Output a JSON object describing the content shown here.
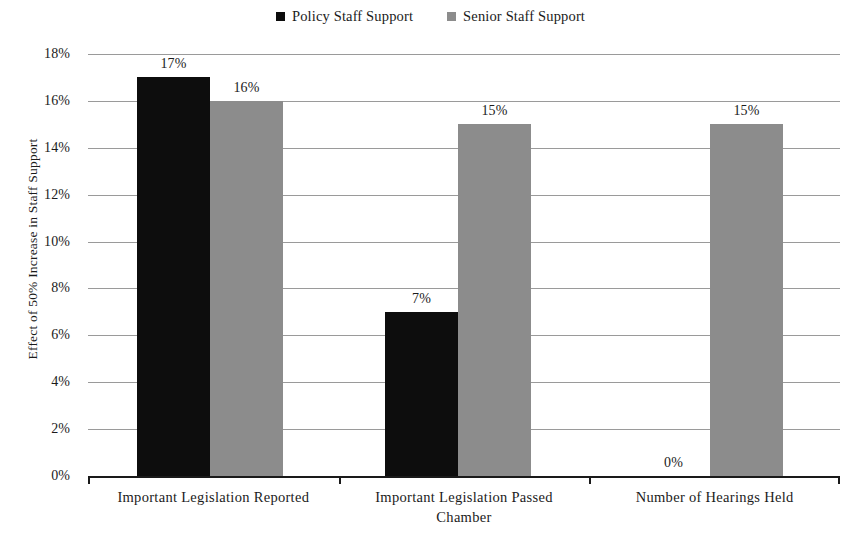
{
  "chart_data": {
    "type": "bar",
    "title": "",
    "subtitle": "",
    "xlabel": "",
    "ylabel": "Effect of 50% Increase in Staff Support",
    "categories": [
      "Important Legislation Reported",
      "Important Legislation Passed\nChamber",
      "Number of Hearings Held"
    ],
    "series": [
      {
        "name": "Policy Staff Support",
        "color": "#0d0d0d",
        "values": [
          17,
          7,
          0
        ],
        "value_labels": [
          "17%",
          "7%",
          "0%"
        ]
      },
      {
        "name": "Senior Staff Support",
        "color": "#8c8c8c",
        "values": [
          16,
          15,
          15
        ],
        "value_labels": [
          "16%",
          "15%",
          "15%"
        ]
      }
    ],
    "ylim": [
      0,
      18
    ],
    "ytick_values": [
      0,
      2,
      4,
      6,
      8,
      10,
      12,
      14,
      16,
      18
    ],
    "ytick_labels": [
      "0%",
      "2%",
      "4%",
      "6%",
      "8%",
      "10%",
      "12%",
      "14%",
      "16%",
      "18%"
    ],
    "grid": true,
    "legend_position": "top-center",
    "units": "percent"
  },
  "legend": {
    "items": [
      {
        "label": "Policy Staff Support",
        "color": "#0d0d0d",
        "marker": "square-marker"
      },
      {
        "label": "Senior Staff Support",
        "color": "#8c8c8c",
        "marker": "square-marker"
      }
    ]
  },
  "axes": {
    "y_title": "Effect of 50% Increase in Staff Support",
    "y_ticks": [
      "18%",
      "16%",
      "14%",
      "12%",
      "10%",
      "8%",
      "6%",
      "4%",
      "2%",
      "0%"
    ],
    "x_categories": [
      "Important Legislation Reported",
      "Important Legislation Passed\nChamber",
      "Number of Hearings Held"
    ]
  }
}
